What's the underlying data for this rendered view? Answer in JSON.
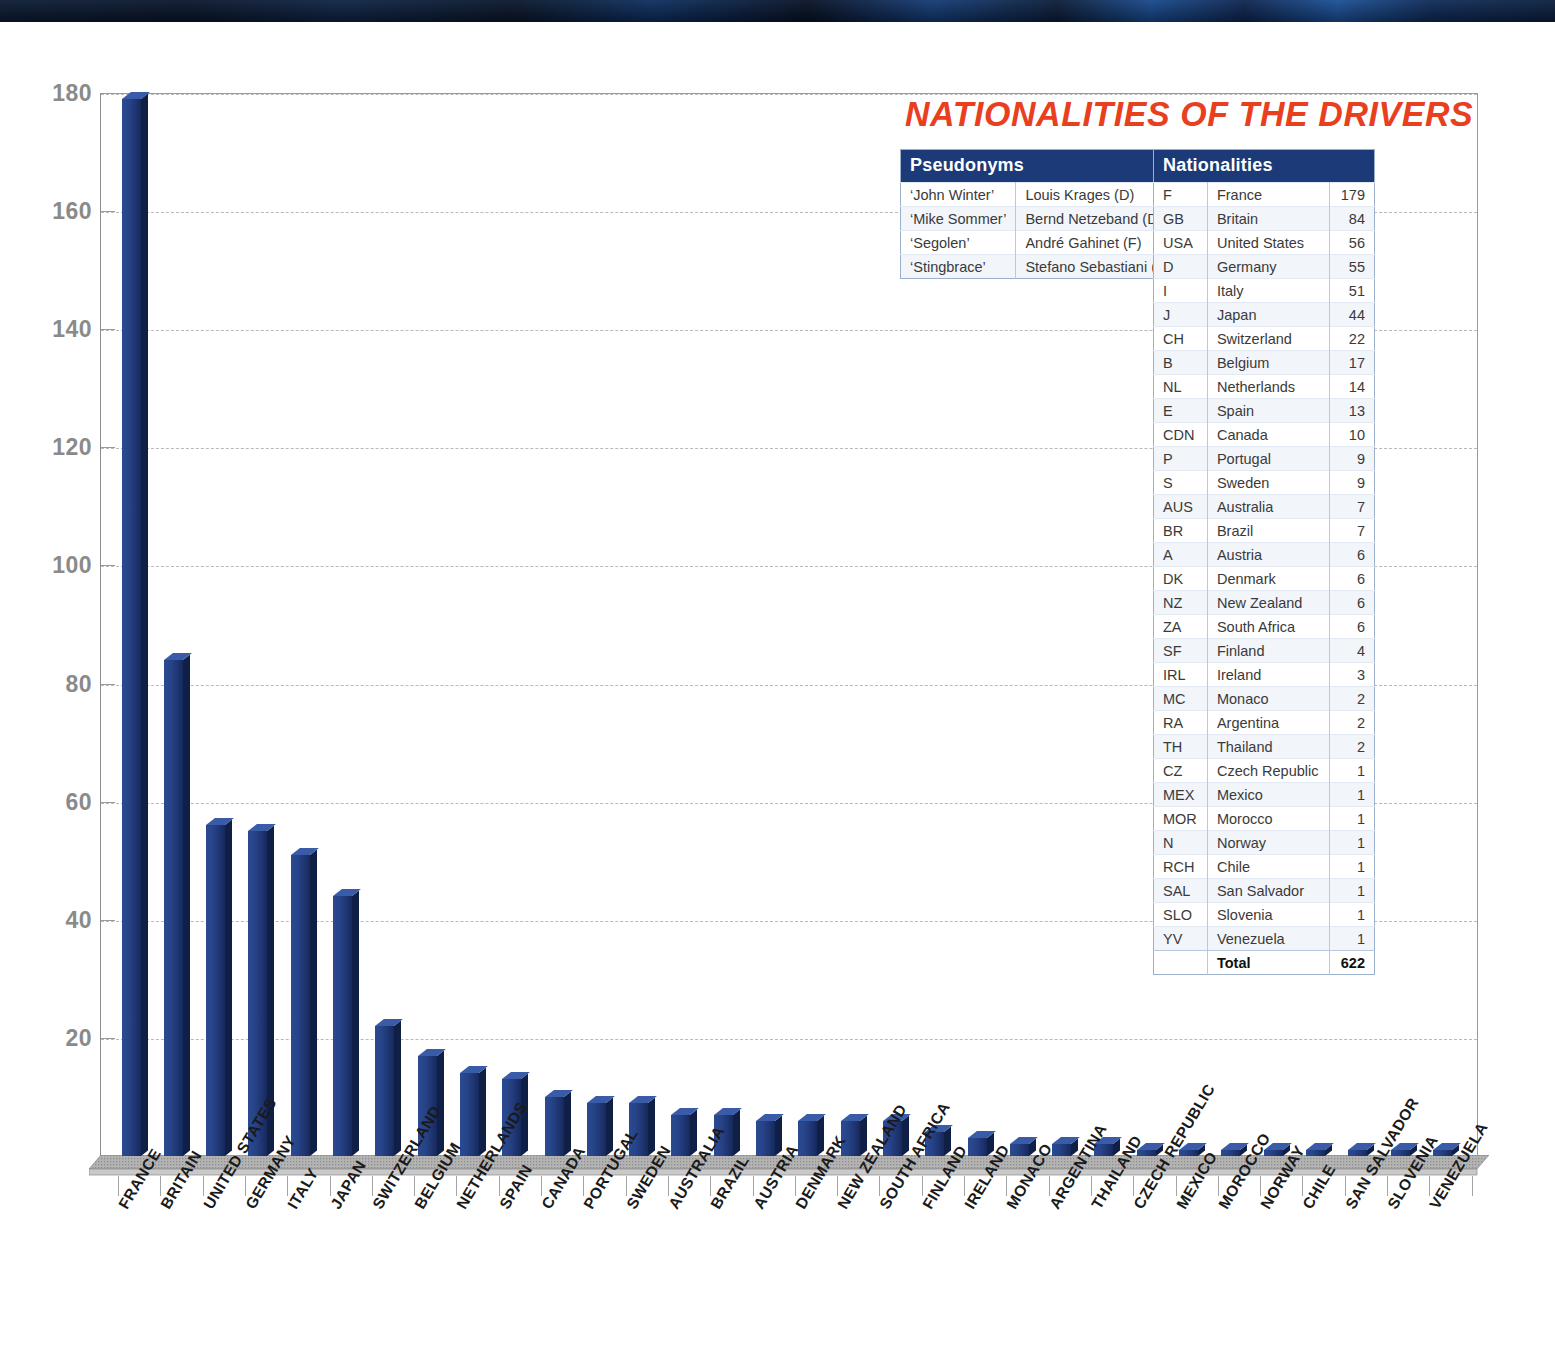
{
  "chart_data": {
    "type": "bar",
    "title": "NATIONALITIES OF THE DRIVERS",
    "xlabel": "",
    "ylabel": "",
    "ylim": [
      0,
      180
    ],
    "yticks": [
      0,
      20,
      40,
      60,
      80,
      100,
      120,
      140,
      160,
      180
    ],
    "ytick_labels": [
      "20",
      "40",
      "60",
      "80",
      "100",
      "120",
      "140",
      "160",
      "180"
    ],
    "grid": true,
    "legend": "none",
    "categories": [
      "FRANCE",
      "BRITAIN",
      "UNITED STATES",
      "GERMANY",
      "ITALY",
      "JAPAN",
      "SWITZERLAND",
      "BELGIUM",
      "NETHERLANDS",
      "SPAIN",
      "CANADA",
      "PORTUGAL",
      "SWEDEN",
      "AUSTRALIA",
      "BRAZIL",
      "AUSTRIA",
      "DENMARK",
      "NEW ZEALAND",
      "SOUTH AFRICA",
      "FINLAND",
      "IRELAND",
      "MONACO",
      "ARGENTINA",
      "THAILAND",
      "CZECH REPUBLIC",
      "MEXICO",
      "MOROCCO",
      "NORWAY",
      "CHILE",
      "SAN SALVADOR",
      "SLOVENIA",
      "VENEZUELA"
    ],
    "values": [
      179,
      84,
      56,
      55,
      51,
      44,
      22,
      17,
      14,
      13,
      10,
      9,
      9,
      7,
      7,
      6,
      6,
      6,
      6,
      4,
      3,
      2,
      2,
      2,
      1,
      1,
      1,
      1,
      1,
      1,
      1,
      1
    ]
  },
  "title": "NATIONALITIES OF THE DRIVERS",
  "colors": {
    "title": "#e8401f",
    "bar": "#27448a",
    "bar_side": "#101f45",
    "bar_top": "#3a5ca8",
    "table_header": "#1b3a77",
    "grid": "#b9b9b9",
    "axis_text": "#8a8a8a"
  },
  "pseudonyms_table": {
    "header": "Pseudonyms",
    "rows": [
      {
        "alias": "‘John Winter’",
        "name": "Louis Krages (D)"
      },
      {
        "alias": "‘Mike Sommer’",
        "name": "Bernd Netzeband (D)"
      },
      {
        "alias": "‘Segolen’",
        "name": "André Gahinet (F)"
      },
      {
        "alias": "‘Stingbrace’",
        "name": "Stefano Sebastiani (I)"
      }
    ]
  },
  "nationalities_table": {
    "header": "Nationalities",
    "rows": [
      {
        "code": "F",
        "country": "France",
        "count": "179"
      },
      {
        "code": "GB",
        "country": "Britain",
        "count": "84"
      },
      {
        "code": "USA",
        "country": "United States",
        "count": "56"
      },
      {
        "code": "D",
        "country": "Germany",
        "count": "55"
      },
      {
        "code": "I",
        "country": "Italy",
        "count": "51"
      },
      {
        "code": "J",
        "country": "Japan",
        "count": "44"
      },
      {
        "code": "CH",
        "country": "Switzerland",
        "count": "22"
      },
      {
        "code": "B",
        "country": "Belgium",
        "count": "17"
      },
      {
        "code": "NL",
        "country": "Netherlands",
        "count": "14"
      },
      {
        "code": "E",
        "country": "Spain",
        "count": "13"
      },
      {
        "code": "CDN",
        "country": "Canada",
        "count": "10"
      },
      {
        "code": "P",
        "country": "Portugal",
        "count": "9"
      },
      {
        "code": "S",
        "country": "Sweden",
        "count": "9"
      },
      {
        "code": "AUS",
        "country": "Australia",
        "count": "7"
      },
      {
        "code": "BR",
        "country": "Brazil",
        "count": "7"
      },
      {
        "code": "A",
        "country": "Austria",
        "count": "6"
      },
      {
        "code": "DK",
        "country": "Denmark",
        "count": "6"
      },
      {
        "code": "NZ",
        "country": "New Zealand",
        "count": "6"
      },
      {
        "code": "ZA",
        "country": "South Africa",
        "count": "6"
      },
      {
        "code": "SF",
        "country": "Finland",
        "count": "4"
      },
      {
        "code": "IRL",
        "country": "Ireland",
        "count": "3"
      },
      {
        "code": "MC",
        "country": "Monaco",
        "count": "2"
      },
      {
        "code": "RA",
        "country": "Argentina",
        "count": "2"
      },
      {
        "code": "TH",
        "country": "Thailand",
        "count": "2"
      },
      {
        "code": "CZ",
        "country": "Czech Republic",
        "count": "1"
      },
      {
        "code": "MEX",
        "country": "Mexico",
        "count": "1"
      },
      {
        "code": "MOR",
        "country": "Morocco",
        "count": "1"
      },
      {
        "code": "N",
        "country": "Norway",
        "count": "1"
      },
      {
        "code": "RCH",
        "country": "Chile",
        "count": "1"
      },
      {
        "code": "SAL",
        "country": "San Salvador",
        "count": "1"
      },
      {
        "code": "SLO",
        "country": "Slovenia",
        "count": "1"
      },
      {
        "code": "YV",
        "country": "Venezuela",
        "count": "1"
      }
    ],
    "total_label": "Total",
    "total_value": "622"
  }
}
